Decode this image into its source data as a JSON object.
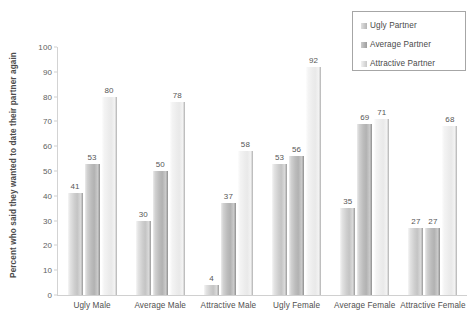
{
  "chart_data": {
    "type": "bar",
    "title": "",
    "xlabel": "",
    "ylabel": "Percent who said they wanted to date their partner again",
    "ylim": [
      0,
      100
    ],
    "ytick_step": 10,
    "yticks": [
      0,
      10,
      20,
      30,
      40,
      50,
      60,
      70,
      80,
      90,
      100
    ],
    "grid": false,
    "legend_position": "top-right",
    "categories": [
      "Ugly Male",
      "Average Male",
      "Attractive Male",
      "Ugly Female",
      "Average Female",
      "Attractive Female"
    ],
    "series": [
      {
        "name": "Ugly Partner",
        "values": [
          41,
          30,
          4,
          53,
          35,
          27
        ]
      },
      {
        "name": "Average Partner",
        "values": [
          53,
          50,
          37,
          56,
          69,
          27
        ]
      },
      {
        "name": "Attractive Partner",
        "values": [
          80,
          78,
          58,
          92,
          71,
          68
        ]
      }
    ],
    "colors": {
      "series_0": "#c4c4c4",
      "series_1": "#b2b2b2",
      "series_2": "#e9e9e9",
      "axis": "#d0d0d0",
      "text": "#4f4f4f"
    }
  },
  "legend": {
    "items": [
      {
        "label": "Ugly Partner"
      },
      {
        "label": "Average Partner"
      },
      {
        "label": "Attractive Partner"
      }
    ]
  }
}
